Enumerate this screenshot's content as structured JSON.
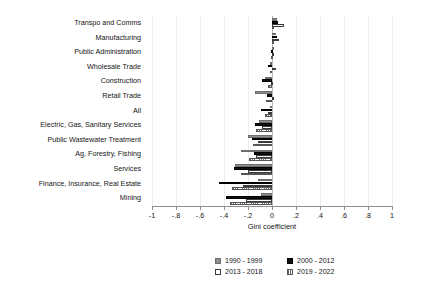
{
  "chart_data": {
    "type": "bar",
    "orientation": "horizontal",
    "title": "",
    "xlabel": "Gini coefficient",
    "ylabel": "",
    "xlim": [
      -1,
      1
    ],
    "xticks": [
      -1,
      -0.8,
      -0.6,
      -0.4,
      -0.2,
      0,
      0.2,
      0.4,
      0.6,
      0.8,
      1
    ],
    "xticklabels": [
      "-1",
      "-.8",
      "-.6",
      "-.4",
      "-.2",
      "0",
      ".2",
      ".4",
      ".6",
      ".8",
      "1"
    ],
    "grid": true,
    "legend_position": "bottom",
    "categories": [
      "Transpo and Comms",
      "Manufacturing",
      "Public Administration",
      "Wholesale Trade",
      "Construction",
      "Retail Trade",
      "All",
      "Electric, Gas, Sanitary Services",
      "Public Wastewater Treatment",
      "Ag, Forestry, Fishing",
      "Services",
      "Finance, Insurance, Real Estate",
      "Mining"
    ],
    "series": [
      {
        "name": "1990 - 1999",
        "color": "#8e8e8e",
        "values": [
          0.04,
          0.03,
          0.0,
          -0.02,
          -0.06,
          -0.14,
          -0.02,
          -0.11,
          -0.2,
          -0.26,
          -0.31,
          -0.12,
          -0.09
        ]
      },
      {
        "name": "2000 - 2012",
        "color": "#111111",
        "values": [
          0.05,
          0.04,
          -0.01,
          -0.03,
          -0.08,
          -0.04,
          -0.09,
          -0.14,
          -0.17,
          -0.15,
          -0.32,
          -0.44,
          -0.38
        ]
      },
      {
        "name": "2013 - 2018",
        "color": "#ffffff",
        "values": [
          0.1,
          0.06,
          0.01,
          0.03,
          -0.01,
          0.02,
          -0.03,
          -0.08,
          -0.12,
          -0.13,
          -0.2,
          -0.24,
          -0.22
        ]
      },
      {
        "name": "2019 - 2022",
        "color": "#ffffff",
        "values": [
          0.02,
          0.02,
          -0.01,
          -0.02,
          -0.03,
          -0.05,
          -0.06,
          -0.13,
          -0.16,
          -0.19,
          -0.26,
          -0.33,
          -0.35
        ]
      }
    ]
  },
  "legend": {
    "entries": [
      {
        "label": "1990 - 1999"
      },
      {
        "label": "2000 - 2012"
      },
      {
        "label": "2013 - 2018"
      },
      {
        "label": "2019 - 2022"
      }
    ]
  }
}
